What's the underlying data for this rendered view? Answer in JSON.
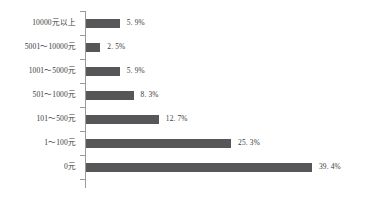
{
  "chart_data": {
    "type": "bar",
    "orientation": "horizontal",
    "title": "",
    "subtitle": "",
    "xlabel": "",
    "ylabel": "",
    "grid": false,
    "legend": false,
    "legend_position": "none",
    "xlim": [
      0,
      39.4
    ],
    "value_suffix": "%",
    "bar_color": "#575759",
    "axis_color": "#9a9a9a",
    "text_color": "#3a3a3a",
    "background_color": "#ffffff",
    "categories": [
      "10000元以上",
      "5001～10000元",
      "1001～5000元",
      "501～1000元",
      "101～500元",
      "1～100元",
      "0元"
    ],
    "values": [
      5.9,
      2.5,
      5.9,
      8.3,
      12.7,
      25.3,
      39.4
    ],
    "value_labels": [
      "5. 9%",
      "2. 5%",
      "5. 9%",
      "8. 3%",
      "12. 7%",
      "25. 3%",
      "39. 4%"
    ]
  }
}
